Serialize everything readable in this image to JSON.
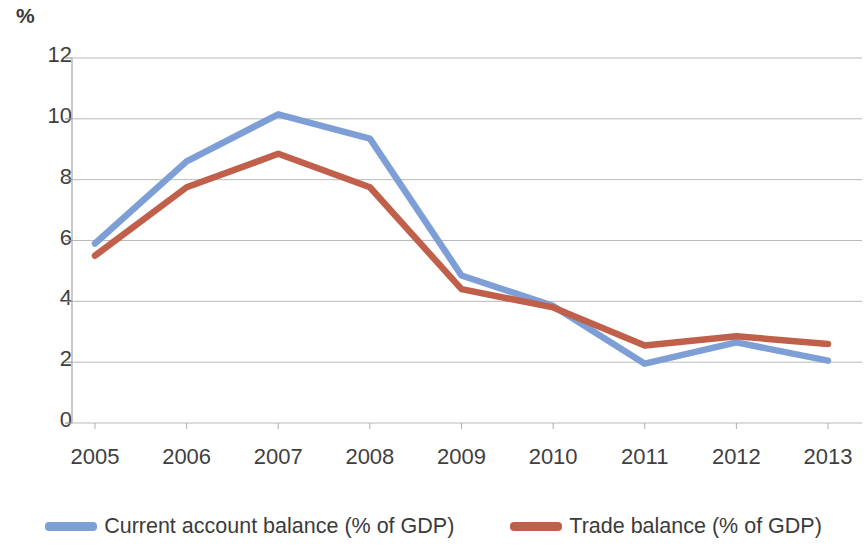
{
  "unit_label": "%",
  "legend": {
    "items": [
      {
        "label": "Current account balance (% of GDP)",
        "color": "#7D9FD6",
        "marker": "line-swatch"
      },
      {
        "label": "Trade balance (% of GDP)",
        "color": "#C0604A",
        "marker": "line-swatch"
      }
    ]
  },
  "chart_data": {
    "type": "line",
    "title": "",
    "subtitle": "",
    "xlabel": "",
    "ylabel": "%",
    "categories": [
      "2005",
      "2006",
      "2007",
      "2008",
      "2009",
      "2010",
      "2011",
      "2012",
      "2013"
    ],
    "x": [
      2005,
      2006,
      2007,
      2008,
      2009,
      2010,
      2011,
      2012,
      2013
    ],
    "yticks": [
      0,
      2,
      4,
      6,
      8,
      10,
      12
    ],
    "xticklabels": [
      "2005",
      "2006",
      "2007",
      "2008",
      "2009",
      "2010",
      "2011",
      "2012",
      "2013"
    ],
    "yticklabels": [
      "0",
      "2",
      "4",
      "6",
      "8",
      "10",
      "12"
    ],
    "ylim": [
      0,
      12
    ],
    "grid": true,
    "grid_axis": "y",
    "legend_position": "bottom",
    "series": [
      {
        "name": "Current account balance (% of GDP)",
        "color": "#7D9FD6",
        "values": [
          5.9,
          8.6,
          10.15,
          9.35,
          4.85,
          3.85,
          1.95,
          2.65,
          2.05
        ]
      },
      {
        "name": "Trade balance (% of GDP)",
        "color": "#C0604A",
        "values": [
          5.5,
          7.75,
          8.85,
          7.75,
          4.4,
          3.8,
          2.55,
          2.85,
          2.6
        ]
      }
    ]
  }
}
